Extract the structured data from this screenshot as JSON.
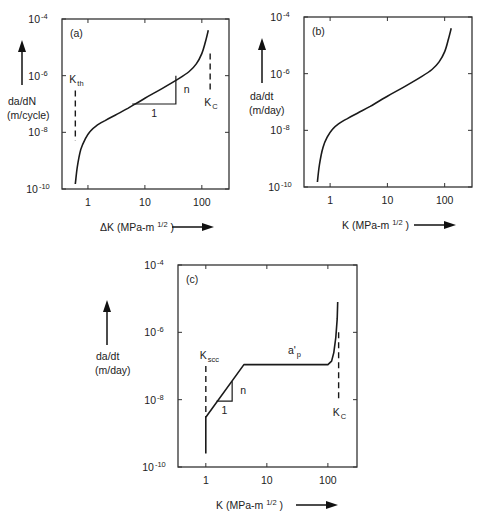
{
  "chart_data": [
    {
      "type": "line",
      "panel_label": "(a)",
      "xlabel": "ΔK (MPa-m",
      "xlabel_sup": "1/2",
      "xlabel_end": ")",
      "ylabel_line1": "da/dN",
      "ylabel_line2": "(m/cycle)",
      "xscale": "log",
      "yscale": "log",
      "xlim": [
        0.35,
        300
      ],
      "ylim": [
        1e-10,
        0.0001
      ],
      "x_ticks": [
        {
          "value": 1,
          "label": "1"
        },
        {
          "value": 10,
          "label": "10"
        },
        {
          "value": 100,
          "label": "100"
        }
      ],
      "y_ticks": [
        {
          "value": 1e-10,
          "base": "10",
          "exp": "-10"
        },
        {
          "value": 1e-08,
          "base": "10",
          "exp": "-8"
        },
        {
          "value": 1e-06,
          "base": "10",
          "exp": "-6"
        },
        {
          "value": 0.0001,
          "base": "10",
          "exp": "-4"
        }
      ],
      "series": [
        {
          "name": "crack growth rate",
          "x": [
            0.6,
            0.65,
            0.75,
            0.9,
            1.1,
            1.4,
            2,
            3,
            5,
            10,
            20,
            40,
            60,
            80,
            100,
            115,
            130
          ],
          "y": [
            1.5e-10,
            6e-10,
            2.5e-09,
            6e-09,
            1.1e-08,
            1.7e-08,
            2.6e-08,
            4e-08,
            7e-08,
            1.6e-07,
            3.5e-07,
            8e-07,
            1.4e-06,
            2.6e-06,
            6e-06,
            1.5e-05,
            4e-05
          ]
        }
      ],
      "slope_triangle": {
        "x1": 6,
        "x2": 35,
        "y_low": 1e-07,
        "y_high": 1e-06,
        "run_label": "1",
        "rise_label": "n"
      },
      "annotations": [
        {
          "label": "K",
          "sub": "th",
          "x": 0.6,
          "y_top": 3e-07,
          "y_bottom": 5e-09
        },
        {
          "label": "K",
          "sub": "C",
          "x": 140,
          "y_top": 6e-06,
          "y_bottom": 3e-07
        }
      ]
    },
    {
      "type": "line",
      "panel_label": "(b)",
      "xlabel": "K (MPa-m",
      "xlabel_sup": "1/2",
      "xlabel_end": ")",
      "ylabel_line1": "da/dt",
      "ylabel_line2": "(m/day)",
      "xscale": "log",
      "yscale": "log",
      "xlim": [
        0.35,
        300
      ],
      "ylim": [
        1e-10,
        0.0001
      ],
      "x_ticks": [
        {
          "value": 1,
          "label": "1"
        },
        {
          "value": 10,
          "label": "10"
        },
        {
          "value": 100,
          "label": "100"
        }
      ],
      "y_ticks": [
        {
          "value": 1e-10,
          "base": "10",
          "exp": "-10"
        },
        {
          "value": 1e-08,
          "base": "10",
          "exp": "-8"
        },
        {
          "value": 1e-06,
          "base": "10",
          "exp": "-6"
        },
        {
          "value": 0.0001,
          "base": "10",
          "exp": "-4"
        }
      ],
      "series": [
        {
          "name": "crack growth rate",
          "x": [
            0.6,
            0.65,
            0.75,
            0.9,
            1.1,
            1.4,
            2,
            3,
            5,
            10,
            20,
            40,
            60,
            80,
            100,
            115,
            130
          ],
          "y": [
            1.5e-10,
            6e-10,
            2.5e-09,
            6e-09,
            1.1e-08,
            1.7e-08,
            2.6e-08,
            4e-08,
            7e-08,
            1.6e-07,
            3.5e-07,
            8e-07,
            1.4e-06,
            2.6e-06,
            6e-06,
            1.5e-05,
            4e-05
          ]
        }
      ],
      "slope_triangle": null,
      "annotations": []
    },
    {
      "type": "line",
      "panel_label": "(c)",
      "xlabel": "K (MPa-m",
      "xlabel_sup": "1/2",
      "xlabel_end": ")",
      "ylabel_line1": "da/dt",
      "ylabel_line2": "(m/day)",
      "xscale": "log",
      "yscale": "log",
      "xlim": [
        0.35,
        300
      ],
      "ylim": [
        1e-10,
        0.0001
      ],
      "x_ticks": [
        {
          "value": 1,
          "label": "1"
        },
        {
          "value": 10,
          "label": "10"
        },
        {
          "value": 100,
          "label": "100"
        }
      ],
      "y_ticks": [
        {
          "value": 1e-10,
          "base": "10",
          "exp": "-10"
        },
        {
          "value": 1e-08,
          "base": "10",
          "exp": "-8"
        },
        {
          "value": 1e-06,
          "base": "10",
          "exp": "-6"
        },
        {
          "value": 0.0001,
          "base": "10",
          "exp": "-4"
        }
      ],
      "series": [
        {
          "name": "crack growth rate",
          "x": [
            1,
            1,
            4.2,
            100,
            115,
            125,
            135,
            142,
            145
          ],
          "y": [
            2.5e-10,
            3e-09,
            1.1e-07,
            1.1e-07,
            1.4e-07,
            2.5e-07,
            7e-07,
            2.5e-06,
            8e-06
          ]
        }
      ],
      "slope_triangle": {
        "x1": 1.5,
        "x2": 2.7,
        "y_low": 9e-09,
        "y_high": 3.5e-08,
        "run_label": "1",
        "rise_label": "n"
      },
      "annotations": [
        {
          "label": "K",
          "sub": "scc",
          "x": 1,
          "y_top": 1e-07,
          "y_bottom": 3e-09
        },
        {
          "label": "K",
          "sub": "C",
          "x": 150,
          "y_top": 1e-06,
          "y_bottom": 1e-08
        },
        {
          "label": "a'",
          "sub": "p",
          "x": 30,
          "y": 1.5e-07
        }
      ]
    }
  ]
}
